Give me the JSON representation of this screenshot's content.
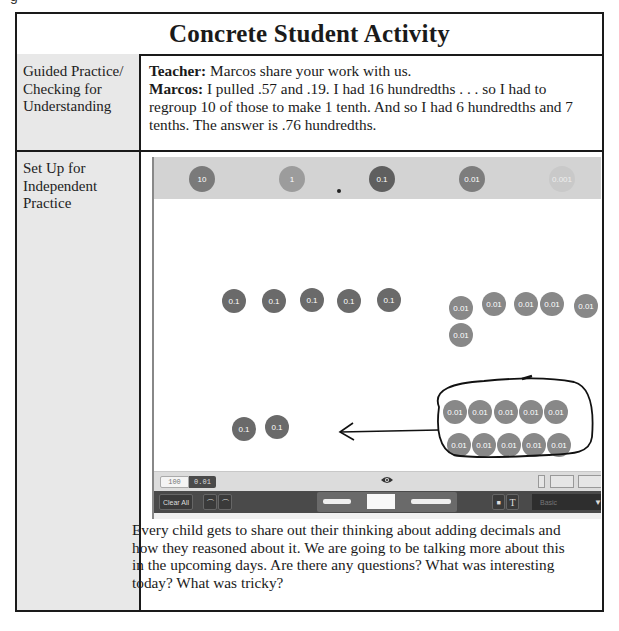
{
  "figure_label_fragment": "g",
  "table": {
    "title": "Concrete Student Activity",
    "rows": [
      {
        "label": "Guided Practice/ Checking for Understanding",
        "label_lines": [
          "Guided Practice/",
          "Checking for",
          "Understanding"
        ],
        "dialogue": [
          {
            "speaker": "Teacher:",
            "text": " Marcos share your work with us."
          },
          {
            "speaker": "Marcos:",
            "text": " I pulled .57 and .19. I had 16 hundredths . . . so I had to regroup 10 of those to make 1 tenth. And so I had 6 hundredths and 7 tenths. The answer is .76 hundredths."
          }
        ]
      },
      {
        "label": "Set Up for Independent Practice",
        "label_lines": [
          "Set Up for",
          "Independent",
          "Practice"
        ],
        "closing_text": "Every child gets to share out their thinking about adding decimals and how they reasoned about it. We are going to be talking more about this in the upcoming days. Are there any questions? What was interesting today? What was tricky?"
      }
    ]
  },
  "app_screenshot": {
    "place_value_bar": {
      "discs": [
        "10",
        "1",
        "0.1",
        "0.01",
        "0.001"
      ],
      "decimal_point": "."
    },
    "workspace": {
      "tenths_row": [
        "0.1",
        "0.1",
        "0.1",
        "0.1",
        "0.1"
      ],
      "hundredths_group": [
        "0.01",
        "0.01",
        "0.01",
        "0.01",
        "0.01",
        "0.01"
      ],
      "regrouped_tenths": [
        "0.1",
        "0.1"
      ],
      "circled_hundredths_row1": [
        "0.01",
        "0.01",
        "0.01",
        "0.01",
        "0.01"
      ],
      "circled_hundredths_row2": [
        "0.01",
        "0.01",
        "0.01",
        "0.01",
        "0.01"
      ],
      "annotation": "hand-drawn loop around 10 hundredths with arrow pointing left toward tenths"
    },
    "status_bar": {
      "mode_options": [
        "100",
        "0.01"
      ],
      "selected_mode": "0.01",
      "eye_icon": "eye-icon"
    },
    "toolbar": {
      "clear_all": "Clear All",
      "undo_icon": "undo-icon",
      "redo_icon": "redo-icon",
      "pen_tools": [
        "marker-tool",
        "eraser-tool",
        "pen-tool"
      ],
      "shape_icon": "shape-icon",
      "text_icon": "T",
      "dropdown_value": "Basic",
      "dropdown_arrow": "▼"
    },
    "colors": {
      "disc_tenth": "#6a6a6a",
      "disc_hundredth": "#888888",
      "top_bar": "#d3d3d3",
      "toolbar": "#4a4a4a"
    }
  }
}
